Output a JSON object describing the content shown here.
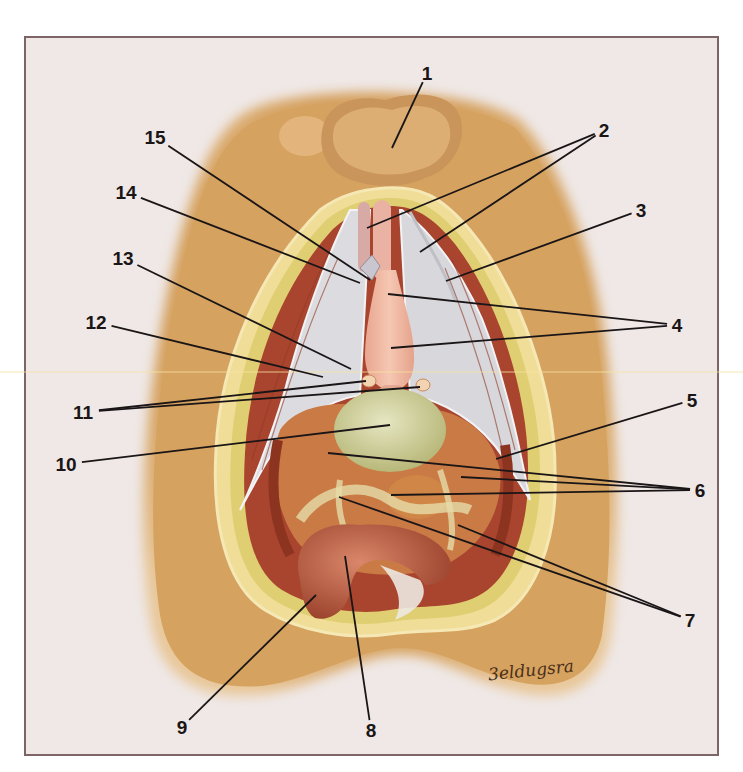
{
  "figure": {
    "type": "anatomical illustration",
    "signature": "3eldugsra",
    "colors": {
      "background": "#efe8e6",
      "frame_border": "#7d6466",
      "skin": "#d9a765",
      "fat": "#e2d27a",
      "muscle": "#b2533b",
      "fascia": "#d9d9dc",
      "organ_pink": "#f1b7a0",
      "bladder": "#cfcf9a",
      "rectum": "#b45a3f",
      "leader_line": "#1a1516"
    }
  },
  "labels": [
    {
      "id": "1",
      "text": "1",
      "x": 427,
      "y": 73,
      "targets": [
        [
          392,
          148
        ]
      ]
    },
    {
      "id": "2",
      "text": "2",
      "x": 604,
      "y": 130,
      "targets": [
        [
          367,
          228
        ],
        [
          420,
          252
        ]
      ]
    },
    {
      "id": "3",
      "text": "3",
      "x": 641,
      "y": 210,
      "targets": [
        [
          446,
          281
        ]
      ]
    },
    {
      "id": "4",
      "text": "4",
      "x": 677,
      "y": 325,
      "targets": [
        [
          388,
          294
        ],
        [
          391,
          348
        ]
      ]
    },
    {
      "id": "5",
      "text": "5",
      "x": 692,
      "y": 400,
      "targets": [
        [
          496,
          459
        ]
      ]
    },
    {
      "id": "6",
      "text": "6",
      "x": 700,
      "y": 490,
      "targets": [
        [
          328,
          453
        ],
        [
          461,
          477
        ],
        [
          391,
          495
        ]
      ]
    },
    {
      "id": "7",
      "text": "7",
      "x": 690,
      "y": 620,
      "targets": [
        [
          339,
          497
        ],
        [
          458,
          525
        ]
      ]
    },
    {
      "id": "8",
      "text": "8",
      "x": 371,
      "y": 730,
      "targets": [
        [
          345,
          556
        ]
      ]
    },
    {
      "id": "9",
      "text": "9",
      "x": 182,
      "y": 727,
      "targets": [
        [
          316,
          595
        ]
      ]
    },
    {
      "id": "10",
      "text": "10",
      "x": 66,
      "y": 464,
      "targets": [
        [
          390,
          425
        ]
      ]
    },
    {
      "id": "11",
      "text": "11",
      "x": 83,
      "y": 412,
      "targets": [
        [
          366,
          381
        ],
        [
          420,
          387
        ]
      ]
    },
    {
      "id": "12",
      "text": "12",
      "x": 96,
      "y": 322,
      "targets": [
        [
          323,
          377
        ]
      ]
    },
    {
      "id": "13",
      "text": "13",
      "x": 123,
      "y": 258,
      "targets": [
        [
          351,
          369
        ]
      ]
    },
    {
      "id": "14",
      "text": "14",
      "x": 126,
      "y": 192,
      "targets": [
        [
          360,
          283
        ]
      ]
    },
    {
      "id": "15",
      "text": "15",
      "x": 155,
      "y": 137,
      "targets": [
        [
          370,
          280
        ]
      ]
    }
  ]
}
